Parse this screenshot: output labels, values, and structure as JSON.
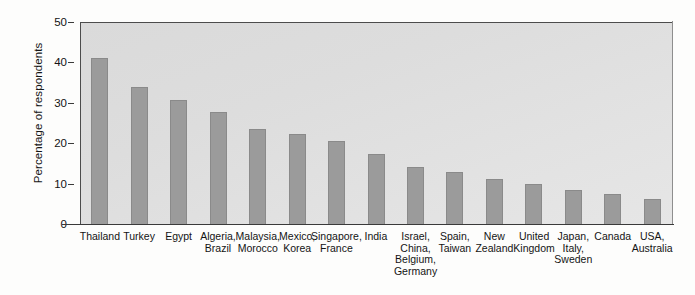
{
  "chart_data": {
    "type": "bar",
    "title": "",
    "xlabel": "",
    "ylabel": "Percentage of respondents",
    "ylim": [
      0,
      50
    ],
    "yticks": [
      0,
      10,
      20,
      30,
      40,
      50
    ],
    "ytick_labels": [
      "0",
      "10",
      "20",
      "30",
      "40",
      "50"
    ],
    "grid": false,
    "legend": "none",
    "orientation": "vertical",
    "bar_color": "#9b9b9b",
    "plot_background": "#dedede",
    "categories": [
      "Thailand",
      "Turkey",
      "Egypt",
      "Algeria, Brazil",
      "Malaysia, Morocco",
      "Mexico, Korea",
      "Singapore, France",
      "India",
      "Israel, China, Belgium, Germany",
      "Spain, Taiwan",
      "New Zealand",
      "United Kingdom",
      "Japan, Italy, Sweden",
      "Canada",
      "USA, Australia"
    ],
    "category_lines": [
      [
        "Thailand"
      ],
      [
        "Turkey"
      ],
      [
        "Egypt"
      ],
      [
        "Algeria,",
        "Brazil"
      ],
      [
        "Malaysia,",
        "Morocco"
      ],
      [
        "Mexico,",
        "Korea"
      ],
      [
        "Singapore,",
        "France"
      ],
      [
        "India"
      ],
      [
        "Israel,",
        "China,",
        "Belgium,",
        "Germany"
      ],
      [
        "Spain,",
        "Taiwan"
      ],
      [
        "New",
        "Zealand"
      ],
      [
        "United",
        "Kingdom"
      ],
      [
        "Japan,",
        "Italy,",
        "Sweden"
      ],
      [
        "Canada"
      ],
      [
        "USA,",
        "Australia"
      ]
    ],
    "values": [
      41,
      33.8,
      30.8,
      27.8,
      23.6,
      22.4,
      20.5,
      17.3,
      14.1,
      12.9,
      11.1,
      10.0,
      8.4,
      7.4,
      6.2
    ]
  }
}
